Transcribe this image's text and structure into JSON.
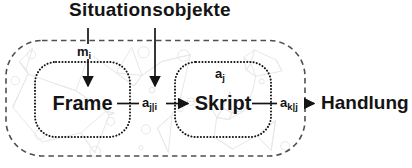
{
  "colors": {
    "ink": "#141414",
    "boundary": "#4f4f4f",
    "texture": "#e7e7e7",
    "background": "#ffffff"
  },
  "diagram": {
    "title": "Situationsobjekte",
    "nodes": {
      "frame": {
        "label": "Frame"
      },
      "skript": {
        "label": "Skript"
      },
      "handlung": {
        "label": "Handlung"
      }
    },
    "labels": {
      "m_i": {
        "base": "m",
        "sub": "i"
      },
      "a_j_given_i": {
        "base": "a",
        "sub": "j|i"
      },
      "a_j": {
        "base": "a",
        "sub": "j"
      },
      "a_k_given_j": {
        "base": "a",
        "sub": "k|j"
      }
    }
  }
}
